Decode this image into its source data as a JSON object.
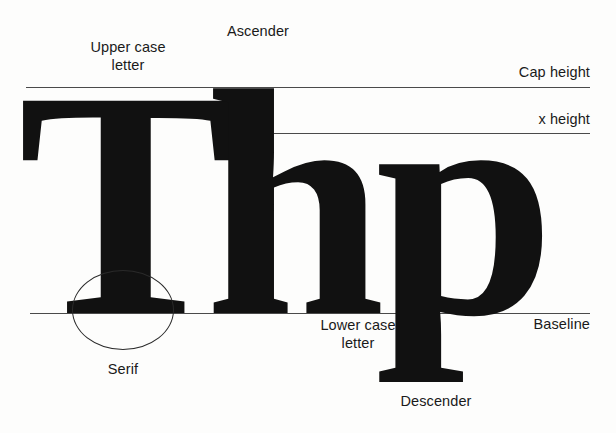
{
  "diagram": {
    "background_color": "#fdfdfc",
    "ink_color": "#111111",
    "line_color": "#4a4a4a",
    "specimen_text": "Thp",
    "letters": [
      {
        "char": "T",
        "case": "upper",
        "feature": "serif"
      },
      {
        "char": "h",
        "case": "lower",
        "feature": "ascender"
      },
      {
        "char": "p",
        "case": "lower",
        "feature": "descender"
      }
    ]
  },
  "guides": [
    {
      "id": "cap-height",
      "label": "Cap height",
      "y": 87
    },
    {
      "id": "x-height",
      "label": "x height",
      "y": 133
    },
    {
      "id": "baseline",
      "label": "Baseline",
      "y": 313
    }
  ],
  "callouts": {
    "upper_case_letter": "Upper case\nletter",
    "ascender": "Ascender",
    "serif": "Serif",
    "lower_case_letter": "Lower case\nletter",
    "descender": "Descender"
  }
}
